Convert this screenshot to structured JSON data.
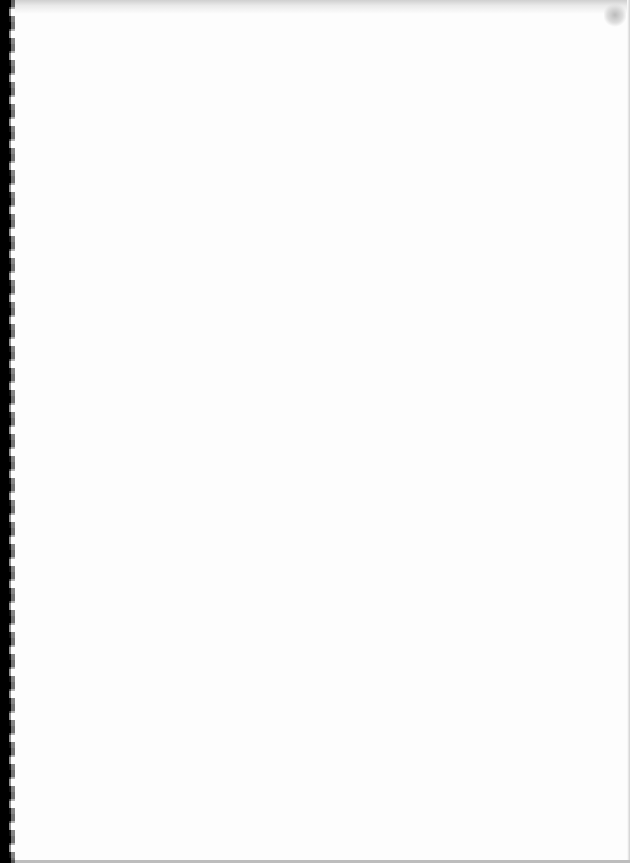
{
  "document": {
    "type": "scanned-page",
    "content": "",
    "colors": {
      "page": "#fdfdfd",
      "binding": "#000000"
    }
  }
}
